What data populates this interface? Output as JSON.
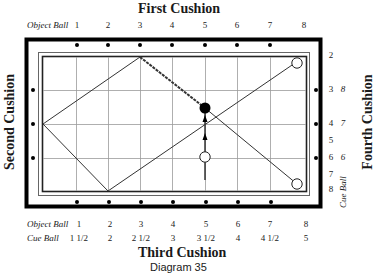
{
  "titles": {
    "top": "First Cushion",
    "left": "Second Cushion",
    "bottom": "Third Cushion",
    "right": "Fourth Cushion",
    "caption": "Diagram 35"
  },
  "top_scale": {
    "label": "Object Ball",
    "numbers": [
      "1",
      "2",
      "3",
      "4",
      "5",
      "6",
      "7",
      "8"
    ]
  },
  "right_scale": {
    "label": "Cue Ball",
    "object_numbers": [
      "2",
      "3",
      "4",
      "5",
      "6",
      "7",
      "8"
    ],
    "cue_numbers": [
      "8",
      "7",
      "6"
    ]
  },
  "bottom_scale": {
    "object_label": "Object Ball",
    "object_numbers": [
      "1",
      "2",
      "3",
      "4",
      "5",
      "6",
      "7",
      "8"
    ],
    "cue_label": "Cue Ball",
    "cue_numbers": [
      "1 1/2",
      "2",
      "2 1/2",
      "3",
      "3 1/2",
      "4",
      "4 1/2",
      "5"
    ]
  },
  "balls": [
    {
      "name": "object-ball",
      "color": "#000000",
      "position": "diamond 5 line, between 3rd and 4th rows"
    },
    {
      "name": "cue-ball",
      "color": "#ffffff",
      "position": "below object ball"
    },
    {
      "name": "target-ball-top-right",
      "color": "#ffffff"
    },
    {
      "name": "target-ball-bottom-right",
      "color": "#ffffff"
    }
  ],
  "colors": {
    "line": "#333333",
    "grid": "#aaaaaa",
    "frame": "#000000"
  }
}
